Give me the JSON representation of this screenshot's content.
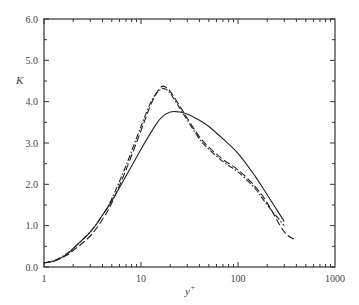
{
  "chart_data": {
    "type": "line",
    "title": "",
    "xlabel": "y+",
    "ylabel": "K",
    "xscale": "log",
    "xlim": [
      1,
      1000
    ],
    "ylim": [
      0,
      6.0
    ],
    "grid": false,
    "legend": null,
    "x_ticks": [
      "1",
      "10",
      "100",
      "1000"
    ],
    "y_ticks": [
      "0.0",
      "1.0",
      "2.0",
      "3.0",
      "4.0",
      "5.0",
      "6.0"
    ],
    "series": [
      {
        "name": "solid",
        "style": "solid",
        "x": [
          1,
          1.3,
          1.7,
          2,
          3,
          4,
          5,
          7,
          10,
          13,
          16,
          20,
          25,
          30,
          40,
          50,
          70,
          100,
          150,
          200,
          300
        ],
        "y": [
          0.1,
          0.15,
          0.3,
          0.45,
          0.85,
          1.25,
          1.6,
          2.2,
          2.85,
          3.3,
          3.6,
          3.75,
          3.75,
          3.7,
          3.55,
          3.4,
          3.1,
          2.75,
          2.2,
          1.75,
          1.1
        ]
      },
      {
        "name": "long-dash",
        "style": "dashed",
        "x": [
          1,
          1.3,
          1.7,
          2,
          3,
          4,
          5,
          7,
          10,
          13,
          16,
          18,
          20,
          25,
          30,
          40,
          50,
          70,
          100,
          150,
          200,
          300,
          400
        ],
        "y": [
          0.1,
          0.15,
          0.28,
          0.4,
          0.75,
          1.15,
          1.55,
          2.35,
          3.3,
          4.0,
          4.35,
          4.35,
          4.25,
          3.9,
          3.6,
          3.15,
          2.9,
          2.6,
          2.35,
          1.95,
          1.55,
          0.85,
          0.65
        ]
      },
      {
        "name": "dash-dot",
        "style": "dashdot",
        "x": [
          1,
          1.3,
          1.7,
          2,
          3,
          4,
          5,
          7,
          10,
          13,
          16,
          18,
          20,
          25,
          30,
          40,
          50,
          70,
          100,
          150,
          200,
          300
        ],
        "y": [
          0.1,
          0.16,
          0.32,
          0.45,
          0.85,
          1.25,
          1.65,
          2.45,
          3.4,
          4.05,
          4.3,
          4.3,
          4.2,
          3.85,
          3.55,
          3.1,
          2.85,
          2.55,
          2.3,
          1.9,
          1.5,
          1.0
        ]
      }
    ]
  }
}
